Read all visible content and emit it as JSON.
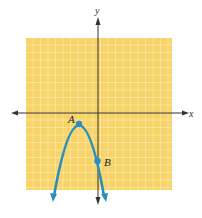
{
  "figure": {
    "type": "coordinate-plane",
    "axes": {
      "x_label": "x",
      "y_label": "y"
    },
    "grid": {
      "visible": true,
      "background": "#f7d36a",
      "line_color": "#fff5d0"
    },
    "curve": {
      "kind": "parabola",
      "opens": "down",
      "color": "#2a8fbf",
      "description": "downward-opening parabola with arrows on both ends"
    },
    "points": [
      {
        "label": "A",
        "role": "vertex"
      },
      {
        "label": "B",
        "role": "y-intercept"
      }
    ]
  }
}
